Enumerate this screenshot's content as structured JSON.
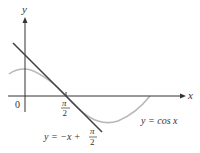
{
  "diagram": {
    "axes": {
      "x_label": "x",
      "y_label": "y",
      "origin_label": "0",
      "tick_label_num": "π",
      "tick_label_den": "2"
    },
    "curves": [
      {
        "name": "cosine",
        "label": "y = cos x",
        "color": "#b8b8b8"
      },
      {
        "name": "tangent-line",
        "label_prefix": "y = −x + ",
        "label_frac_num": "π",
        "label_frac_den": "2",
        "color": "#444444"
      }
    ]
  }
}
